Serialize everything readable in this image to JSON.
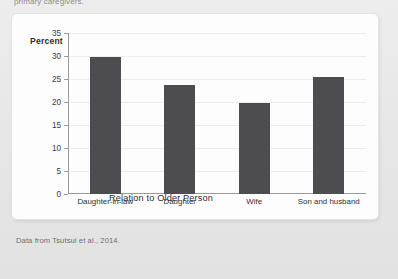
{
  "page": {
    "top_caption": "primary caregivers.",
    "source_note": "Data from Tsutsui et al., 2014."
  },
  "chart_data": {
    "type": "bar",
    "title": "",
    "categories": [
      "Daughter-in-law",
      "Daughter",
      "Wife",
      "Son and husband"
    ],
    "values": [
      29.8,
      23.8,
      19.8,
      25.5
    ],
    "series": [
      {
        "name": "Percent of primary caregivers",
        "values": [
          29.8,
          23.8,
          19.8,
          25.5
        ]
      }
    ],
    "xlabel": "Relation to Older Person",
    "ylabel": "Percent",
    "ylim": [
      0,
      35
    ],
    "yticks": [
      0,
      5,
      10,
      15,
      20,
      25,
      30,
      35
    ],
    "ytick_labels": [
      "0",
      "5",
      "10",
      "15",
      "20",
      "25",
      "30",
      "35"
    ],
    "grid": true,
    "grid_axis": "y",
    "legend": false,
    "bar_color": "#4d4d4f",
    "axis_color": "#9a9a9c",
    "grid_color": "#ececec",
    "plot_background": "#fdfdfd"
  }
}
